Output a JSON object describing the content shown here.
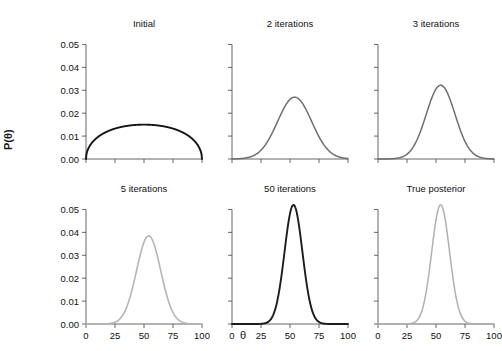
{
  "figure": {
    "xlabel": "θ",
    "ylabel": "P(θ)",
    "background": "#ffffff"
  },
  "axes": {
    "y_ticks": [
      "0.00",
      "0.01",
      "0.02",
      "0.03",
      "0.04",
      "0.05"
    ],
    "x_ticks": [
      "0",
      "25",
      "50",
      "75",
      "100"
    ]
  },
  "chart_data": {
    "type": "line",
    "title": "",
    "subtitle": "",
    "xlabel": "θ",
    "ylabel": "P(θ)",
    "xlim": [
      0,
      100
    ],
    "ylim": [
      0.0,
      0.055
    ],
    "grid": false,
    "legend": "none",
    "layout": {
      "rows": 2,
      "cols": 3,
      "shared_x": true,
      "shared_y": true
    },
    "x_ticks": [
      0,
      25,
      50,
      75,
      100
    ],
    "y_ticks": [
      0.0,
      0.01,
      0.02,
      0.03,
      0.04,
      0.05
    ],
    "panels": [
      {
        "title": "Initial",
        "row": 0,
        "col": 0,
        "shape": "semicircular-arc",
        "color": "#141414",
        "linewidth": 1.9,
        "peak_x": 50,
        "peak_y": 0.015,
        "support": [
          0,
          100
        ],
        "x": [
          0,
          5,
          10,
          15,
          20,
          25,
          30,
          35,
          40,
          45,
          50,
          55,
          60,
          65,
          70,
          75,
          80,
          85,
          90,
          95,
          100
        ],
        "y": [
          0.0,
          0.0047,
          0.0082,
          0.0104,
          0.012,
          0.0131,
          0.0139,
          0.0144,
          0.0148,
          0.015,
          0.015,
          0.015,
          0.0148,
          0.0144,
          0.0139,
          0.0131,
          0.012,
          0.0104,
          0.0082,
          0.0047,
          0.0
        ]
      },
      {
        "title": "2 iterations",
        "row": 0,
        "col": 1,
        "shape": "gaussian",
        "color": "#6e6e6e",
        "linewidth": 1.5,
        "peak_x": 54,
        "peak_y": 0.027,
        "sigma": 14.7,
        "x": [
          0,
          5,
          10,
          15,
          20,
          25,
          30,
          35,
          40,
          45,
          50,
          55,
          60,
          65,
          70,
          75,
          80,
          85,
          90,
          95,
          100
        ],
        "y": [
          0.0001,
          0.0002,
          0.0005,
          0.0012,
          0.0026,
          0.005,
          0.0086,
          0.0133,
          0.0185,
          0.0232,
          0.0262,
          0.027,
          0.0254,
          0.0218,
          0.0172,
          0.0125,
          0.0083,
          0.005,
          0.0027,
          0.0013,
          0.0006
        ]
      },
      {
        "title": "3 iterations",
        "row": 0,
        "col": 2,
        "shape": "gaussian",
        "color": "#6e6e6e",
        "linewidth": 1.5,
        "peak_x": 54,
        "peak_y": 0.0322,
        "sigma": 12.4,
        "x": [
          0,
          5,
          10,
          15,
          20,
          25,
          30,
          35,
          40,
          45,
          50,
          55,
          60,
          65,
          70,
          75,
          80,
          85,
          90,
          95,
          100
        ],
        "y": [
          0.0,
          0.0001,
          0.0002,
          0.0006,
          0.0015,
          0.0035,
          0.0071,
          0.0126,
          0.0196,
          0.0265,
          0.0311,
          0.0322,
          0.0296,
          0.0241,
          0.0176,
          0.0116,
          0.0069,
          0.0037,
          0.0018,
          0.0008,
          0.0003
        ]
      },
      {
        "title": "5 iterations",
        "row": 1,
        "col": 0,
        "shape": "gaussian",
        "color": "#b5b5b5",
        "linewidth": 1.6,
        "peak_x": 54,
        "peak_y": 0.0385,
        "sigma": 10.4,
        "x": [
          0,
          5,
          10,
          15,
          20,
          25,
          30,
          35,
          40,
          45,
          50,
          55,
          60,
          65,
          70,
          75,
          80,
          85,
          90,
          95,
          100
        ],
        "y": [
          0.0,
          0.0,
          0.0001,
          0.0002,
          0.0007,
          0.0021,
          0.0054,
          0.0115,
          0.0206,
          0.0305,
          0.0371,
          0.0385,
          0.0345,
          0.0265,
          0.0176,
          0.0101,
          0.005,
          0.0021,
          0.0008,
          0.0002,
          0.0001
        ]
      },
      {
        "title": "50 iterations",
        "row": 1,
        "col": 1,
        "shape": "gaussian",
        "color": "#1c1c1c",
        "linewidth": 1.9,
        "peak_x": 53,
        "peak_y": 0.052,
        "sigma": 7.7,
        "x": [
          0,
          5,
          10,
          15,
          20,
          25,
          30,
          35,
          40,
          45,
          50,
          55,
          60,
          65,
          70,
          75,
          80,
          85,
          90,
          95,
          100
        ],
        "y": [
          0.0,
          0.0,
          0.0,
          0.0,
          0.0001,
          0.0004,
          0.002,
          0.0072,
          0.0196,
          0.0388,
          0.0506,
          0.0509,
          0.0394,
          0.0203,
          0.0076,
          0.0021,
          0.0004,
          0.0001,
          0.0,
          0.0,
          0.0
        ]
      },
      {
        "title": "True posterior",
        "row": 1,
        "col": 2,
        "shape": "gaussian",
        "color": "#b0b0b0",
        "linewidth": 1.5,
        "peak_x": 54,
        "peak_y": 0.052,
        "sigma": 7.7,
        "x": [
          0,
          5,
          10,
          15,
          20,
          25,
          30,
          35,
          40,
          45,
          50,
          55,
          60,
          65,
          70,
          75,
          80,
          85,
          90,
          95,
          100
        ],
        "y": [
          0.0,
          0.0,
          0.0,
          0.0,
          0.0,
          0.0003,
          0.0014,
          0.0054,
          0.0158,
          0.0341,
          0.0484,
          0.052,
          0.0436,
          0.0243,
          0.01,
          0.003,
          0.0007,
          0.0001,
          0.0,
          0.0,
          0.0
        ]
      }
    ]
  }
}
